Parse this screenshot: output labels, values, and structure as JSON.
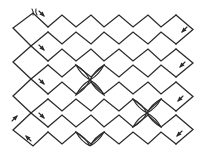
{
  "diagram": {
    "title": "",
    "stroke_color": "#2a2a2a",
    "background": "#ffffff",
    "strands": {
      "count": 8,
      "peak_x_odd": [
        62,
        91,
        119,
        148,
        176
      ],
      "valley_x_odd": [
        48,
        76,
        104,
        133,
        161
      ],
      "rows": [
        {
          "top": 15,
          "bottom": 27
        },
        {
          "top": 32,
          "bottom": 44
        },
        {
          "top": 49,
          "bottom": 61
        },
        {
          "top": 65,
          "bottom": 77
        },
        {
          "top": 82,
          "bottom": 94
        },
        {
          "top": 99,
          "bottom": 111
        },
        {
          "top": 115,
          "bottom": 127
        },
        {
          "top": 132,
          "bottom": 144
        }
      ],
      "right_turn_x": 193,
      "left_turn_x": 13,
      "left_cross_x": 31
    },
    "crossings": [
      {
        "center": [
          90,
          80
        ],
        "ends": [
          [
            76,
            65
          ],
          [
            104,
            65
          ],
          [
            76,
            95
          ],
          [
            104,
            95
          ]
        ]
      },
      {
        "center": [
          147,
          113
        ],
        "ends": [
          [
            133,
            99
          ],
          [
            161,
            99
          ],
          [
            133,
            127
          ],
          [
            161,
            127
          ]
        ]
      },
      {
        "center": [
          90,
          146
        ],
        "ends": [
          [
            76,
            132
          ],
          [
            104,
            132
          ]
        ]
      }
    ],
    "arrows": [
      {
        "name": "arrow-top-start",
        "x": 44,
        "y": 16,
        "dir": "down-right"
      },
      {
        "name": "arrow-right-1",
        "x": 182,
        "y": 32,
        "dir": "down-left"
      },
      {
        "name": "arrow-left-2",
        "x": 44,
        "y": 50,
        "dir": "down-right"
      },
      {
        "name": "arrow-right-2",
        "x": 180,
        "y": 67,
        "dir": "down-left"
      },
      {
        "name": "arrow-left-3",
        "x": 44,
        "y": 84,
        "dir": "down-right"
      },
      {
        "name": "arrow-right-3",
        "x": 178,
        "y": 101,
        "dir": "down-left"
      },
      {
        "name": "arrow-left-4",
        "x": 44,
        "y": 118,
        "dir": "down-right"
      },
      {
        "name": "arrow-left-up",
        "x": 17,
        "y": 116,
        "dir": "up-right"
      },
      {
        "name": "arrow-bottom-left",
        "x": 26,
        "y": 136,
        "dir": "up-left"
      },
      {
        "name": "arrow-right-4",
        "x": 177,
        "y": 136,
        "dir": "down-left"
      }
    ],
    "thread_ends": {
      "x": 34,
      "y": 12
    }
  }
}
